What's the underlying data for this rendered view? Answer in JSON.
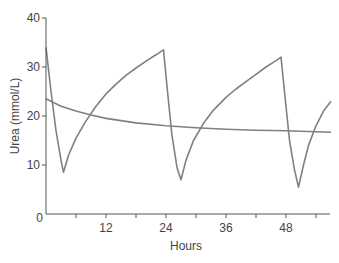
{
  "chart_data": {
    "type": "line",
    "title": "",
    "xlabel": "Hours",
    "ylabel": "Urea (mmol/L)",
    "xlim": [
      0,
      57
    ],
    "ylim": [
      0,
      40
    ],
    "grid": false,
    "legend": null,
    "x_ticks": [
      0,
      6,
      12,
      18,
      24,
      30,
      36,
      42,
      48,
      54
    ],
    "x_tick_labels": [
      "0",
      "",
      "12",
      "",
      "24",
      "",
      "36",
      "",
      "48",
      ""
    ],
    "y_ticks": [
      0,
      10,
      20,
      30,
      40
    ],
    "y_tick_labels": [
      "0",
      "10",
      "20",
      "30",
      "40"
    ],
    "series": [
      {
        "name": "intermittent-dialysis",
        "color": "#808080",
        "points": [
          [
            0,
            34
          ],
          [
            1,
            25
          ],
          [
            2,
            17
          ],
          [
            3,
            11
          ],
          [
            3.5,
            8.5
          ],
          [
            4.5,
            12
          ],
          [
            6,
            15.5
          ],
          [
            8,
            19
          ],
          [
            10,
            22
          ],
          [
            12,
            24.5
          ],
          [
            14,
            26.5
          ],
          [
            16,
            28.3
          ],
          [
            18,
            29.8
          ],
          [
            20,
            31.2
          ],
          [
            22,
            32.5
          ],
          [
            23.5,
            33.5
          ],
          [
            24.3,
            25
          ],
          [
            25.2,
            16
          ],
          [
            26.2,
            9.5
          ],
          [
            27,
            7
          ],
          [
            28,
            11
          ],
          [
            29.5,
            15
          ],
          [
            31.5,
            18.5
          ],
          [
            33.5,
            21.2
          ],
          [
            36,
            23.8
          ],
          [
            38,
            25.5
          ],
          [
            40,
            27
          ],
          [
            42,
            28.5
          ],
          [
            44,
            30
          ],
          [
            46,
            31.3
          ],
          [
            47,
            32
          ],
          [
            47.8,
            24
          ],
          [
            48.7,
            15
          ],
          [
            49.7,
            9
          ],
          [
            50.5,
            5.5
          ],
          [
            51.5,
            10
          ],
          [
            52.5,
            14
          ],
          [
            54,
            18
          ],
          [
            55.5,
            21
          ],
          [
            57,
            23
          ]
        ]
      },
      {
        "name": "continuous-therapy",
        "color": "#999999",
        "points": [
          [
            0,
            23.5
          ],
          [
            3,
            22
          ],
          [
            6,
            21
          ],
          [
            9,
            20.2
          ],
          [
            12,
            19.5
          ],
          [
            18,
            18.6
          ],
          [
            24,
            18
          ],
          [
            30,
            17.6
          ],
          [
            36,
            17.3
          ],
          [
            42,
            17.1
          ],
          [
            48,
            17
          ],
          [
            57,
            16.7
          ]
        ]
      }
    ]
  },
  "axes": {
    "x_title": "Hours",
    "y_title": "Urea (mmol/L)"
  },
  "colors": {
    "axis": "#555555",
    "series_primary": "#808080",
    "series_secondary": "#999999",
    "text": "#444444"
  }
}
